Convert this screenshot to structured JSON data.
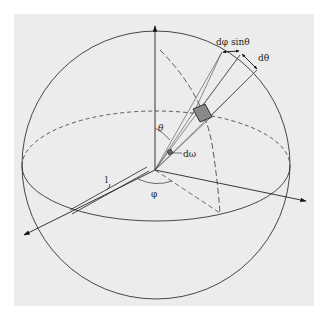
{
  "figure": {
    "labels": {
      "dphi_sintheta": "dφ sinθ",
      "dtheta": "dθ",
      "theta": "θ",
      "domega": "dω",
      "phi": "φ",
      "length": "l"
    },
    "colors": {
      "background": "#ffffff",
      "panel": "#ececec",
      "stroke": "#333333",
      "patch_fill": "#8a8a8a"
    }
  }
}
